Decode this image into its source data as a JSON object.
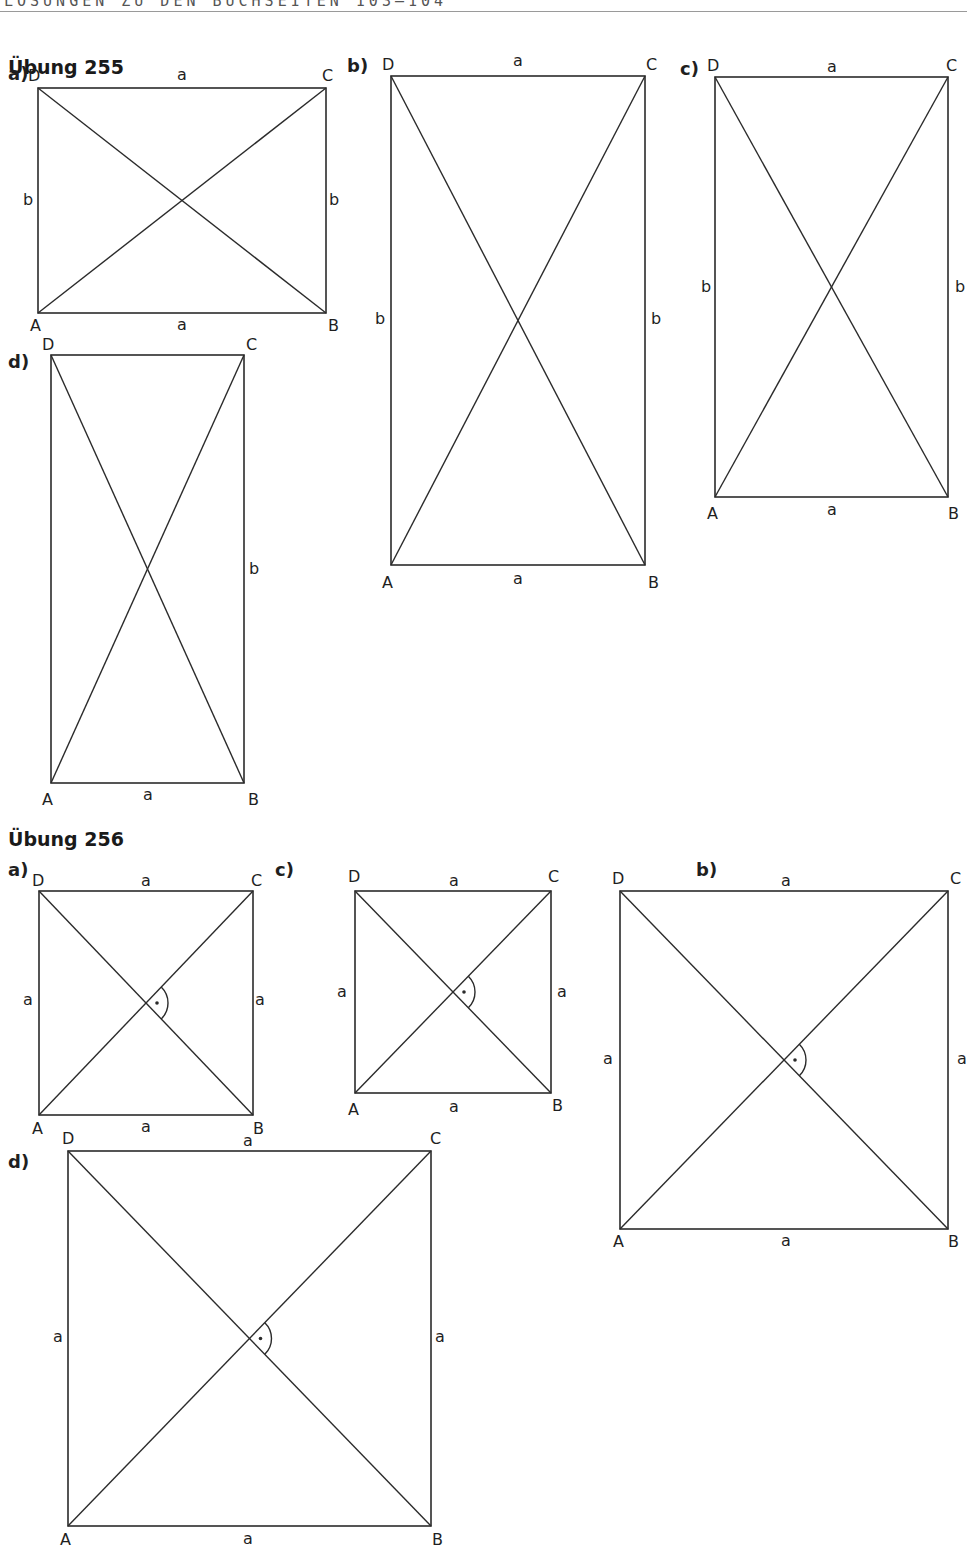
{
  "header": {
    "running_title": "LÖSUNGEN ZU DEN BUCHSEITEN 103–104"
  },
  "sections": [
    {
      "title": "Übung 255",
      "title_pos": [
        8,
        78
      ],
      "figures": [
        {
          "part": "a)",
          "part_pos": [
            8,
            80
          ],
          "rect": [
            38,
            88,
            326,
            313
          ],
          "vertices": {
            "A": [
              30,
              331
            ],
            "B": [
              328,
              331
            ],
            "C": [
              322,
              81
            ],
            "D": [
              28,
              81
            ]
          },
          "sides": [
            {
              "label": "a",
              "pos": [
                182,
                80
              ]
            },
            {
              "label": "a",
              "pos": [
                182,
                330
              ]
            },
            {
              "label": "b",
              "pos": [
                28,
                205
              ]
            },
            {
              "label": "b",
              "pos": [
                334,
                205
              ]
            }
          ],
          "right_angle": false
        },
        {
          "part": "b)",
          "part_pos": [
            347,
            72
          ],
          "rect": [
            391,
            76,
            645,
            565
          ],
          "vertices": {
            "A": [
              382,
              588
            ],
            "B": [
              648,
              588
            ],
            "C": [
              646,
              70
            ],
            "D": [
              382,
              70
            ]
          },
          "sides": [
            {
              "label": "a",
              "pos": [
                518,
                66
              ]
            },
            {
              "label": "a",
              "pos": [
                518,
                584
              ]
            },
            {
              "label": "b",
              "pos": [
                380,
                324
              ]
            },
            {
              "label": "b",
              "pos": [
                656,
                324
              ]
            }
          ],
          "right_angle": false
        },
        {
          "part": "c)",
          "part_pos": [
            680,
            75
          ],
          "rect": [
            715,
            77,
            948,
            497
          ],
          "vertices": {
            "A": [
              707,
              519
            ],
            "B": [
              948,
              519
            ],
            "C": [
              946,
              71
            ],
            "D": [
              707,
              71
            ]
          },
          "sides": [
            {
              "label": "a",
              "pos": [
                832,
                72
              ]
            },
            {
              "label": "a",
              "pos": [
                832,
                515
              ]
            },
            {
              "label": "b",
              "pos": [
                706,
                292
              ]
            },
            {
              "label": "b",
              "pos": [
                960,
                292
              ]
            }
          ],
          "right_angle": false
        },
        {
          "part": "d)",
          "part_pos": [
            8,
            368
          ],
          "rect": [
            51,
            355,
            244,
            783
          ],
          "vertices": {
            "A": [
              42,
              805
            ],
            "B": [
              248,
              805
            ],
            "C": [
              246,
              350
            ],
            "D": [
              42,
              350
            ]
          },
          "sides": [
            {
              "label": "a",
              "pos": [
                148,
                800
              ]
            },
            {
              "label": "b",
              "pos": [
                254,
                574
              ]
            }
          ],
          "right_angle": false
        }
      ]
    },
    {
      "title": "Übung 256",
      "title_pos": [
        8,
        850
      ],
      "figures": [
        {
          "part": "a)",
          "part_pos": [
            8,
            876
          ],
          "rect": [
            39,
            891,
            253,
            1115
          ],
          "vertices": {
            "A": [
              32,
              1134
            ],
            "B": [
              253,
              1134
            ],
            "C": [
              251,
              886
            ],
            "D": [
              32,
              886
            ]
          },
          "sides": [
            {
              "label": "a",
              "pos": [
                146,
                886
              ]
            },
            {
              "label": "a",
              "pos": [
                146,
                1132
              ]
            },
            {
              "label": "a",
              "pos": [
                28,
                1005
              ]
            },
            {
              "label": "a",
              "pos": [
                260,
                1005
              ]
            }
          ],
          "right_angle": true
        },
        {
          "part": "c)",
          "part_pos": [
            275,
            876
          ],
          "rect": [
            355,
            891,
            551,
            1093
          ],
          "vertices": {
            "A": [
              348,
              1115
            ],
            "B": [
              552,
              1111
            ],
            "C": [
              548,
              882
            ],
            "D": [
              348,
              882
            ]
          },
          "sides": [
            {
              "label": "a",
              "pos": [
                454,
                886
              ]
            },
            {
              "label": "a",
              "pos": [
                454,
                1112
              ]
            },
            {
              "label": "a",
              "pos": [
                342,
                997
              ]
            },
            {
              "label": "a",
              "pos": [
                562,
                997
              ]
            }
          ],
          "right_angle": true
        },
        {
          "part": "b)",
          "part_pos": [
            696,
            876
          ],
          "rect": [
            620,
            891,
            948,
            1229
          ],
          "vertices": {
            "A": [
              613,
              1247
            ],
            "B": [
              948,
              1247
            ],
            "C": [
              950,
              884
            ],
            "D": [
              612,
              884
            ]
          },
          "sides": [
            {
              "label": "a",
              "pos": [
                786,
                886
              ]
            },
            {
              "label": "a",
              "pos": [
                786,
                1246
              ]
            },
            {
              "label": "a",
              "pos": [
                608,
                1064
              ]
            },
            {
              "label": "a",
              "pos": [
                962,
                1064
              ]
            }
          ],
          "right_angle": true
        },
        {
          "part": "d)",
          "part_pos": [
            8,
            1168
          ],
          "rect": [
            68,
            1151,
            431,
            1526
          ],
          "vertices": {
            "A": [
              60,
              1545
            ],
            "B": [
              432,
              1545
            ],
            "C": [
              430,
              1144
            ],
            "D": [
              62,
              1144
            ]
          },
          "sides": [
            {
              "label": "a",
              "pos": [
                248,
                1146
              ]
            },
            {
              "label": "a",
              "pos": [
                248,
                1544
              ]
            },
            {
              "label": "a",
              "pos": [
                58,
                1342
              ]
            },
            {
              "label": "a",
              "pos": [
                440,
                1342
              ]
            }
          ],
          "right_angle": true
        }
      ]
    }
  ],
  "style": {
    "line_color": "#2b2b2b",
    "text_color": "#1f1f1f"
  }
}
